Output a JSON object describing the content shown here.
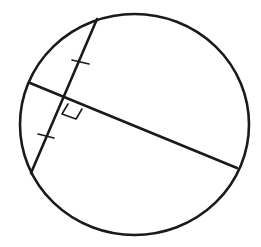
{
  "diagram": {
    "title": "Circle with a chord bisected perpendicularly by a diameter",
    "colors": {
      "ink": "#1a1a1a",
      "background": "#ffffff"
    },
    "circle": {
      "cx": 134.5,
      "cy": 124.5,
      "rx": 114.5,
      "ry": 110.5,
      "stroke_width": 2.6
    },
    "chord": {
      "x1": 97,
      "y1": 19,
      "x2": 31,
      "y2": 173,
      "stroke_width": 2.6
    },
    "diameter": {
      "x1": 30,
      "y1": 83,
      "x2": 237,
      "y2": 168,
      "stroke_width": 2.6
    },
    "intersection": {
      "x": 65,
      "y": 97
    },
    "congruence_ticks": [
      {
        "x1": 72,
        "y1": 60,
        "x2": 89,
        "y2": 64
      },
      {
        "x1": 38,
        "y1": 134,
        "x2": 54,
        "y2": 138
      }
    ],
    "right_angle_marker": {
      "points": "68,104 62,114 76,119 82,109"
    }
  }
}
